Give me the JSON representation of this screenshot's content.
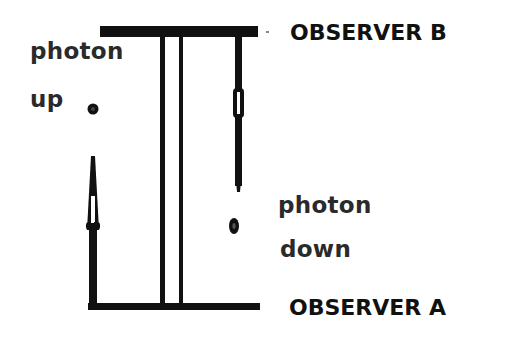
{
  "diagram": {
    "labels": {
      "observer_b": "OBSERVER B",
      "observer_a": "OBSERVER A",
      "photon_up_line1": "photon",
      "photon_up_line2": "up",
      "photon_down_line1": "photon",
      "photon_down_line2": "down"
    },
    "colors": {
      "ink": "#111111",
      "background": "#ffffff"
    },
    "elements": {
      "top_bar": "observer B platform",
      "bottom_bar": "observer A platform",
      "rails": 2,
      "photon_up_arrow": "arrow-up",
      "photon_down_arrow": "arrow-down"
    }
  }
}
